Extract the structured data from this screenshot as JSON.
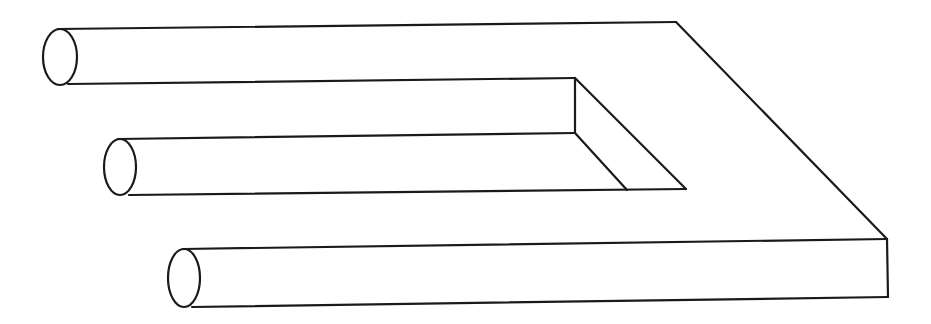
{
  "figure": {
    "title": "Impossible trident (blivet)",
    "stroke_color": "#1a1a1a",
    "background_color": "#ffffff",
    "prongs": [
      {
        "name": "top",
        "ellipse": {
          "cx": 60,
          "cy": 57,
          "rx": 18,
          "ry": 28
        }
      },
      {
        "name": "middle",
        "ellipse": {
          "cx": 121,
          "cy": 167,
          "rx": 17,
          "ry": 28
        }
      },
      {
        "name": "bottom",
        "ellipse": {
          "cx": 185,
          "cy": 278,
          "rx": 17,
          "ry": 29
        }
      }
    ]
  }
}
